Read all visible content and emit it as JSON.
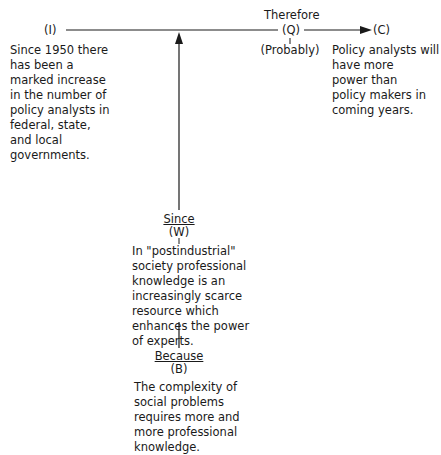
{
  "diagram": {
    "type": "Toulmin argument structure",
    "nodes": {
      "information": {
        "symbol": "(I)",
        "text": "Since 1950 there\nhas been a\nmarked increase\nin the number of\npolicy analysts in\nfederal, state,\nand local\ngovernments."
      },
      "qualifier": {
        "connector": "Therefore",
        "symbol": "(Q)",
        "text": "(Probably)"
      },
      "claim": {
        "symbol": "(C)",
        "text": "Policy analysts will\nhave more\npower than\npolicy makers in\ncoming years."
      },
      "warrant": {
        "connector": "Since",
        "symbol": "(W)",
        "text": "In \"postindustrial\"\nsociety professional\nknowledge is an\nincreasingly scarce\nresource which\nenhances the power\nof experts."
      },
      "backing": {
        "connector": "Because",
        "symbol": "(B)",
        "text": "The complexity of\nsocial problems\nrequires more and\nmore professional\nknowledge."
      }
    },
    "edges": [
      {
        "from": "information",
        "to": "qualifier",
        "style": "line"
      },
      {
        "from": "qualifier",
        "to": "claim",
        "style": "arrow"
      },
      {
        "from": "warrant",
        "to": "main-line",
        "style": "arrow-up"
      },
      {
        "from": "backing",
        "to": "warrant",
        "style": "line"
      }
    ],
    "colors": {
      "ink": "#1a1a1a",
      "background": "#ffffff"
    }
  }
}
